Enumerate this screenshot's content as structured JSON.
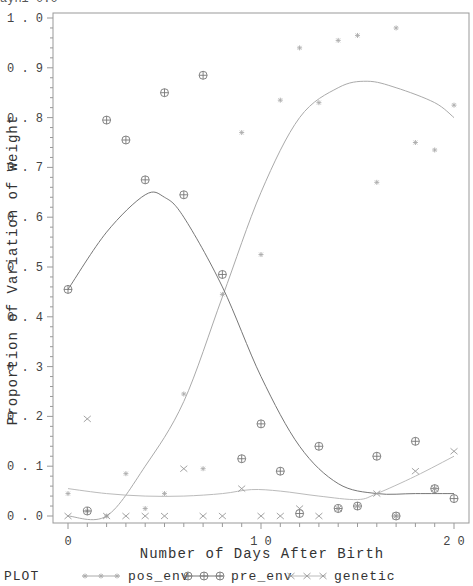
{
  "clipped_header": "ayhi 0.0",
  "chart_data": {
    "type": "scatter",
    "title": "",
    "xlabel": "Number of Days After Birth",
    "ylabel": "Proportion of Variation of Weight",
    "xlim": [
      0,
      20
    ],
    "ylim": [
      0.0,
      1.0
    ],
    "x_ticks": [
      0,
      10,
      20
    ],
    "x_tick_labels": [
      "0",
      "10",
      "20"
    ],
    "y_ticks": [
      0.0,
      0.1,
      0.2,
      0.3,
      0.4,
      0.5,
      0.6,
      0.7,
      0.8,
      0.9,
      1.0
    ],
    "y_tick_labels": [
      "0.0",
      "0.1",
      "0.2",
      "0.3",
      "0.4",
      "0.5",
      "0.6",
      "0.7",
      "0.8",
      "0.9",
      "1.0"
    ],
    "grid": false,
    "legend_position": "bottom",
    "legend_label": "PLOT",
    "series": [
      {
        "name": "pos_env",
        "marker": "asterisk",
        "x": [
          0,
          1,
          2,
          3,
          4,
          5,
          6,
          7,
          8,
          9,
          10,
          11,
          12,
          13,
          14,
          15,
          16,
          17,
          18,
          19,
          20
        ],
        "values": [
          0.045,
          0.01,
          0.0,
          0.085,
          0.015,
          0.045,
          0.245,
          0.095,
          0.445,
          0.77,
          0.525,
          0.835,
          0.94,
          0.83,
          0.955,
          0.965,
          0.67,
          0.98,
          0.75,
          0.735,
          0.825
        ],
        "fit": [
          [
            0,
            0.0
          ],
          [
            2,
            0.0
          ],
          [
            4,
            0.1
          ],
          [
            6,
            0.23
          ],
          [
            8,
            0.44
          ],
          [
            10,
            0.65
          ],
          [
            12,
            0.8
          ],
          [
            14,
            0.86
          ],
          [
            15.5,
            0.873
          ],
          [
            17,
            0.86
          ],
          [
            19,
            0.83
          ],
          [
            20,
            0.8
          ]
        ]
      },
      {
        "name": "pre_env",
        "marker": "circle-plus",
        "x": [
          0,
          1,
          2,
          3,
          4,
          5,
          6,
          7,
          8,
          9,
          10,
          11,
          12,
          13,
          14,
          15,
          16,
          17,
          18,
          19,
          20
        ],
        "values": [
          0.455,
          0.01,
          0.795,
          0.755,
          0.675,
          0.85,
          0.645,
          0.885,
          0.485,
          0.115,
          0.185,
          0.09,
          0.005,
          0.14,
          0.015,
          0.02,
          0.12,
          0.0,
          0.15,
          0.055,
          0.035
        ],
        "fit": [
          [
            0,
            0.455
          ],
          [
            2,
            0.57
          ],
          [
            4,
            0.645
          ],
          [
            5,
            0.64
          ],
          [
            6,
            0.6
          ],
          [
            8,
            0.46
          ],
          [
            10,
            0.28
          ],
          [
            12,
            0.14
          ],
          [
            14,
            0.065
          ],
          [
            16,
            0.045
          ],
          [
            18,
            0.045
          ],
          [
            20,
            0.045
          ]
        ]
      },
      {
        "name": "genetic",
        "marker": "x",
        "x": [
          0,
          1,
          2,
          3,
          4,
          5,
          6,
          7,
          8,
          9,
          10,
          11,
          12,
          13,
          14,
          15,
          16,
          17,
          18,
          19,
          20
        ],
        "values": [
          0.0,
          0.195,
          0.0,
          0.0,
          0.0,
          0.0,
          0.095,
          0.0,
          0.0,
          0.055,
          0.0,
          0.0,
          0.015,
          0.0,
          0.015,
          0.02,
          0.045,
          0.0,
          0.09,
          0.055,
          0.13
        ],
        "fit": [
          [
            0,
            0.055
          ],
          [
            2,
            0.045
          ],
          [
            4,
            0.04
          ],
          [
            6,
            0.04
          ],
          [
            8,
            0.045
          ],
          [
            9.5,
            0.053
          ],
          [
            11,
            0.05
          ],
          [
            13,
            0.04
          ],
          [
            15,
            0.033
          ],
          [
            16,
            0.045
          ],
          [
            18,
            0.08
          ],
          [
            20,
            0.12
          ]
        ]
      }
    ]
  }
}
